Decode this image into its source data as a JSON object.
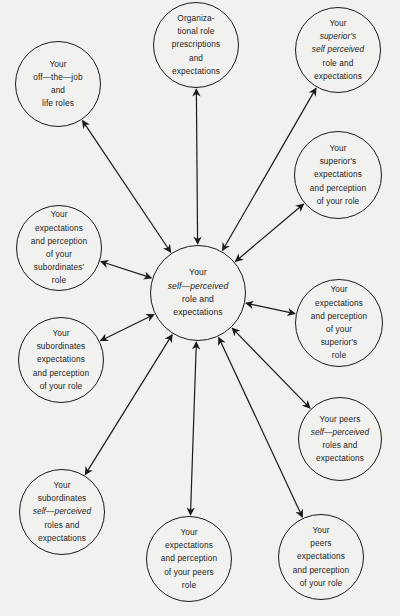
{
  "diagram": {
    "type": "radial-role-set",
    "colors": {
      "background": "#f1f1ef",
      "stroke": "#1a1a1a",
      "text": "#1e1e1e"
    },
    "center": {
      "id": "self",
      "cx": 198,
      "cy": 293,
      "r": 48,
      "lines": [
        {
          "text": "Your",
          "italic": false
        },
        {
          "text": "self—perceived",
          "italic": true
        },
        {
          "text": "role and",
          "italic": false
        },
        {
          "text": "expectations",
          "italic": false
        }
      ]
    },
    "nodes": [
      {
        "id": "org",
        "cx": 196,
        "cy": 45,
        "r": 43,
        "arrow": "bi",
        "lines": [
          {
            "text": "Organiza-"
          },
          {
            "text": "tional role"
          },
          {
            "text": "prescriptions"
          },
          {
            "text": "and"
          },
          {
            "text": "expectations"
          }
        ]
      },
      {
        "id": "offjob",
        "cx": 58,
        "cy": 84,
        "r": 43,
        "arrow": "bi",
        "lines": [
          {
            "text": "Your"
          },
          {
            "text": "off—the—job"
          },
          {
            "text": "and"
          },
          {
            "text": "life roles"
          }
        ]
      },
      {
        "id": "sup-self",
        "cx": 338,
        "cy": 50,
        "r": 43,
        "arrow": "bi",
        "lines": [
          {
            "text": "Your"
          },
          {
            "text": "superior's",
            "italic": true
          },
          {
            "text": "self perceived",
            "italic": true
          },
          {
            "text": "role and"
          },
          {
            "text": "expectations"
          }
        ]
      },
      {
        "id": "sup-exp",
        "cx": 338,
        "cy": 175,
        "r": 44,
        "arrow": "bi",
        "lines": [
          {
            "text": "Your"
          },
          {
            "text": "superior's"
          },
          {
            "text": "expectations"
          },
          {
            "text": "and perception"
          },
          {
            "text": "of your role"
          }
        ]
      },
      {
        "id": "exp-sub",
        "cx": 59,
        "cy": 248,
        "r": 43,
        "arrow": "bi",
        "lines": [
          {
            "text": "Your"
          },
          {
            "text": "expectations"
          },
          {
            "text": "and perception"
          },
          {
            "text": "of your"
          },
          {
            "text": "subordinates'"
          },
          {
            "text": "role"
          }
        ]
      },
      {
        "id": "exp-sup",
        "cx": 339,
        "cy": 323,
        "r": 44,
        "arrow": "bi",
        "lines": [
          {
            "text": "Your"
          },
          {
            "text": "expectations"
          },
          {
            "text": "and perception"
          },
          {
            "text": "of your"
          },
          {
            "text": "superior's"
          },
          {
            "text": "role"
          }
        ]
      },
      {
        "id": "sub-exp",
        "cx": 61,
        "cy": 360,
        "r": 43,
        "arrow": "bi",
        "lines": [
          {
            "text": "Your"
          },
          {
            "text": "subordinates"
          },
          {
            "text": "expectations"
          },
          {
            "text": "and perception"
          },
          {
            "text": "of your role"
          }
        ]
      },
      {
        "id": "peer-self",
        "cx": 340,
        "cy": 439,
        "r": 42,
        "arrow": "bi",
        "lines": [
          {
            "text": "Your peers"
          },
          {
            "text": "self—perceived",
            "italic": true
          },
          {
            "text": "roles and"
          },
          {
            "text": "expectations"
          }
        ]
      },
      {
        "id": "sub-self",
        "cx": 62,
        "cy": 512,
        "r": 43,
        "arrow": "bi",
        "lines": [
          {
            "text": "Your"
          },
          {
            "text": "subordinates"
          },
          {
            "text": "self—perceived",
            "italic": true
          },
          {
            "text": "roles and"
          },
          {
            "text": "expectations"
          }
        ]
      },
      {
        "id": "exp-peer",
        "cx": 189,
        "cy": 559,
        "r": 43,
        "arrow": "bi",
        "lines": [
          {
            "text": "Your"
          },
          {
            "text": "expectations"
          },
          {
            "text": "and perception"
          },
          {
            "text": "of your peers"
          },
          {
            "text": "role"
          }
        ]
      },
      {
        "id": "peer-exp",
        "cx": 321,
        "cy": 557,
        "r": 43,
        "arrow": "bi",
        "lines": [
          {
            "text": "Your"
          },
          {
            "text": "peers"
          },
          {
            "text": "expectations"
          },
          {
            "text": "and perception"
          },
          {
            "text": "of your role"
          }
        ]
      }
    ]
  }
}
